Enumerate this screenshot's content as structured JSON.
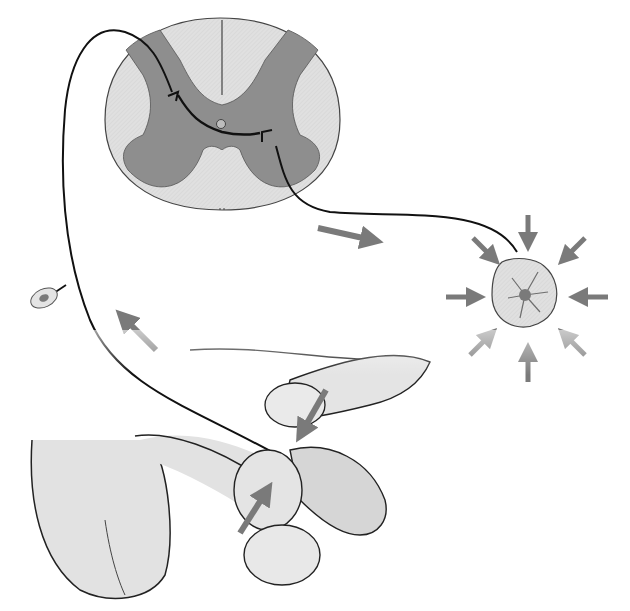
{
  "diagram": {
    "type": "anatomical-reflex-arc",
    "labels": [],
    "colors": {
      "background": "#ffffff",
      "white_matter": "#dcdcdc",
      "gray_matter": "#8e8e8e",
      "skin": "#e2e2e2",
      "skin_dark": "#cfcfcf",
      "arrow": "#7a7a7a",
      "outline": "#222222",
      "nerve": "#111111"
    },
    "elements": [
      {
        "id": "spinal-cord-cross-section",
        "description": "Spinal cord transverse section with butterfly gray matter"
      },
      {
        "id": "sensory-neuron",
        "description": "Afferent fiber from pelvic region to dorsal horn"
      },
      {
        "id": "dorsal-root-ganglion",
        "description": "Small oval ganglion body on left"
      },
      {
        "id": "motor-neuron",
        "description": "Efferent fiber from ventral horn to muscle"
      },
      {
        "id": "contracting-muscle",
        "description": "Muscle cross-section with radial contraction arrows"
      },
      {
        "id": "squeeze-stimulus",
        "description": "Fingers squeezing glans, arrows indicating pressure"
      }
    ],
    "arrows": [
      {
        "id": "afferent-direction",
        "direction": "up-left"
      },
      {
        "id": "efferent-direction",
        "direction": "right"
      },
      {
        "id": "pressure-top",
        "direction": "down-left"
      },
      {
        "id": "pressure-bottom",
        "direction": "up-right"
      },
      {
        "id": "contraction-radial",
        "count": 8,
        "direction": "inward"
      }
    ]
  }
}
